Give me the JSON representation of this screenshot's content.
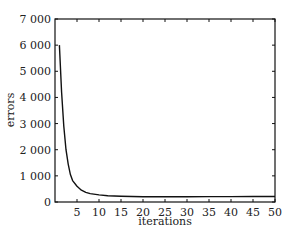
{
  "chart_data": {
    "type": "line",
    "title": "",
    "xlabel": "iterations",
    "ylabel": "errors",
    "xlim": [
      0,
      50
    ],
    "ylim": [
      0,
      7000
    ],
    "grid": false,
    "legend": null,
    "x_ticks": [
      5,
      10,
      15,
      20,
      25,
      30,
      35,
      40,
      45,
      50
    ],
    "x_tick_labels": [
      "5",
      "10",
      "15",
      "20",
      "25",
      "30",
      "35",
      "40",
      "45",
      "50"
    ],
    "y_ticks": [
      0,
      1000,
      2000,
      3000,
      4000,
      5000,
      6000,
      7000
    ],
    "y_tick_labels": [
      "0",
      "1 000",
      "2 000",
      "3 000",
      "4 000",
      "5 000",
      "6 000",
      "7 000"
    ],
    "series": [
      {
        "name": "errors",
        "x": [
          1,
          1.5,
          2,
          2.5,
          3,
          3.5,
          4,
          5,
          6,
          7,
          8,
          10,
          12,
          15,
          20,
          25,
          30,
          35,
          40,
          45,
          50
        ],
        "values": [
          6000,
          4200,
          2900,
          2000,
          1450,
          1050,
          820,
          600,
          450,
          370,
          320,
          270,
          240,
          220,
          200,
          200,
          200,
          205,
          205,
          210,
          210
        ]
      }
    ],
    "colors": {
      "line": "#111111",
      "axes": "#111111"
    }
  }
}
